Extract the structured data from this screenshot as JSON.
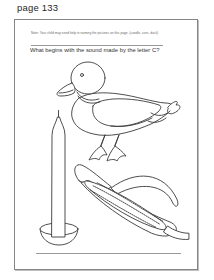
{
  "page_label": "page 133",
  "worksheet": {
    "note": "Note: Your child may need help in naming the pictures on this page. (candle, corn, duck)",
    "question": "What begins with the sound made by the letter C?",
    "illustrations": [
      {
        "name": "duck"
      },
      {
        "name": "candle"
      },
      {
        "name": "corn"
      }
    ]
  },
  "colors": {
    "frame_border": "#858585",
    "rule_line": "#9a9a9a",
    "ink": "#3a3a3a",
    "shading_gray": "#d8d8d8",
    "background": "#ffffff"
  }
}
